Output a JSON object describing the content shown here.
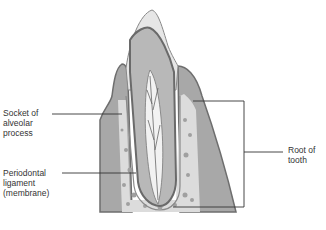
{
  "diagram": {
    "labels": {
      "socket": [
        "Socket of",
        "alveolar",
        "process"
      ],
      "ligament": [
        "Periodontal",
        "ligament",
        "(membrane)"
      ],
      "root": [
        "Root of",
        "tooth"
      ]
    },
    "colors": {
      "line": "#333333",
      "bone_dark": "#7a7a7a",
      "bone_mid": "#a8a8a8",
      "enamel": "#e6e6e6",
      "dentin": "#b8b8b8",
      "pulp": "#f2f2f2",
      "spongy": "#dcdcdc"
    }
  }
}
